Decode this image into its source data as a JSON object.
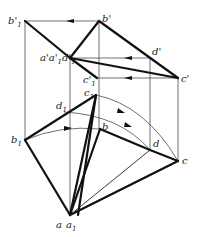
{
  "diagram": {
    "type": "descriptive-geometry rotation construction",
    "colors": {
      "line": "#111111",
      "background": "#ffffff"
    },
    "labels": {
      "b1_prime": "b'",
      "b1_prime_sub": "1",
      "b_prime": "b'",
      "a_stack_prime": "a'a'",
      "a_stack_sub1": "1",
      "d1_prime": "d'",
      "d1_prime_sub": "1",
      "d_prime": "d'",
      "c_prime": "c'",
      "c1_prime": "c'",
      "c1_prime_sub": "1",
      "c1": "c",
      "c1_sub": "1",
      "d1": "d",
      "d1_sub": "1",
      "b1": "b",
      "b1_sub": "1",
      "b": "b",
      "d": "d",
      "c": "c",
      "a": "a",
      "a1": "a",
      "a1_sub": "1"
    },
    "points": {
      "b1_prime": [
        25,
        21
      ],
      "b_prime": [
        99,
        21
      ],
      "a_prime": [
        70,
        58
      ],
      "d_prime": [
        150,
        58
      ],
      "c_prime": [
        178,
        78
      ],
      "c1_prime": [
        97,
        78
      ],
      "c1": [
        96,
        95
      ],
      "d1": [
        64,
        112
      ],
      "b1": [
        25,
        140
      ],
      "b": [
        100,
        129
      ],
      "d": [
        150,
        150
      ],
      "c": [
        178,
        161
      ],
      "a": [
        70,
        215
      ]
    }
  }
}
